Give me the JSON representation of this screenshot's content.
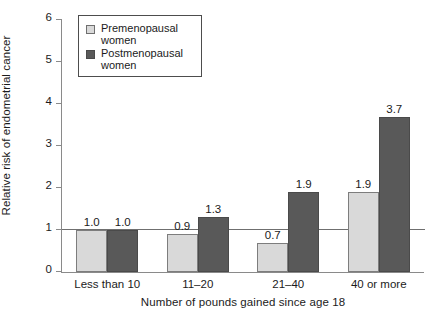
{
  "chart_data": {
    "type": "bar",
    "title": "",
    "xlabel": "Number of pounds gained since age 18",
    "ylabel": "Relative risk of endometrial cancer",
    "categories": [
      "Less than 10",
      "11–20",
      "21–40",
      "40 or more"
    ],
    "series": [
      {
        "name": "Premenopausal women",
        "color": "#d9d9d9",
        "values": [
          1.0,
          0.9,
          0.7,
          1.9
        ],
        "labels": [
          "1.0",
          "0.9",
          "0.7",
          "1.9"
        ]
      },
      {
        "name": "Postmenopausal women",
        "color": "#595959",
        "values": [
          1.0,
          1.3,
          1.9,
          3.7
        ],
        "labels": [
          "1.0",
          "1.3",
          "1.9",
          "3.7"
        ]
      }
    ],
    "ylim": [
      0,
      6
    ],
    "yticks": [
      0,
      1,
      2,
      3,
      4,
      5,
      6
    ],
    "ytick_labels": [
      "0",
      "1",
      "2",
      "3",
      "4",
      "5",
      "6"
    ],
    "grid": false,
    "reference_line": 1.0,
    "legend_position": "top-left"
  },
  "legend": {
    "items": [
      {
        "label": "Premenopausal women",
        "swatch": "legend-swatch-premenopausal"
      },
      {
        "label": "Postmenopausal women",
        "swatch": "legend-swatch-postmenopausal"
      }
    ]
  },
  "axes": {
    "y_title": "Relative risk of endometrial cancer",
    "x_title": "Number of pounds gained since age 18",
    "y_ticks": [
      "6",
      "5",
      "4",
      "3",
      "2",
      "1",
      "0"
    ]
  },
  "groups": [
    {
      "label": "Less than 10",
      "bars": [
        {
          "series": "Premenopausal women",
          "value_label": "1.0"
        },
        {
          "series": "Postmenopausal women",
          "value_label": "1.0"
        }
      ]
    },
    {
      "label": "11–20",
      "bars": [
        {
          "series": "Premenopausal women",
          "value_label": "0.9"
        },
        {
          "series": "Postmenopausal women",
          "value_label": "1.3"
        }
      ]
    },
    {
      "label": "21–40",
      "bars": [
        {
          "series": "Premenopausal women",
          "value_label": "0.7"
        },
        {
          "series": "Postmenopausal women",
          "value_label": "1.9"
        }
      ]
    },
    {
      "label": "40 or more",
      "bars": [
        {
          "series": "Premenopausal women",
          "value_label": "1.9"
        },
        {
          "series": "Postmenopausal women",
          "value_label": "3.7"
        }
      ]
    }
  ]
}
